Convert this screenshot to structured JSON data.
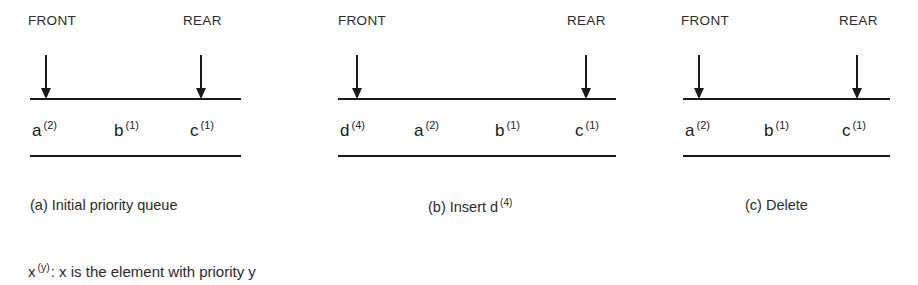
{
  "figure": {
    "width": 918,
    "height": 285,
    "background": "#ffffff",
    "ink_color": "#1a1a1a"
  },
  "panels": [
    {
      "id": "a",
      "front_label": "FRONT",
      "rear_label": "REAR",
      "caption": "(a) Initial priority queue",
      "elements": [
        {
          "name": "a",
          "priority": "(2)"
        },
        {
          "name": "b",
          "priority": "(1)"
        },
        {
          "name": "c",
          "priority": "(1)"
        }
      ]
    },
    {
      "id": "b",
      "front_label": "FRONT",
      "rear_label": "REAR",
      "caption": "(b) Insert d",
      "caption_sup": "(4)",
      "elements": [
        {
          "name": "d",
          "priority": "(4)"
        },
        {
          "name": "a",
          "priority": "(2)"
        },
        {
          "name": "b",
          "priority": "(1)"
        },
        {
          "name": "c",
          "priority": "(1)"
        }
      ]
    },
    {
      "id": "c",
      "front_label": "FRONT",
      "rear_label": "REAR",
      "caption": "(c) Delete",
      "elements": [
        {
          "name": "a",
          "priority": "(2)"
        },
        {
          "name": "b",
          "priority": "(1)"
        },
        {
          "name": "c",
          "priority": "(1)"
        }
      ]
    }
  ],
  "legend": {
    "symbol": "x",
    "symbol_sup": "(y)",
    "text": ": x is the element with priority y"
  }
}
